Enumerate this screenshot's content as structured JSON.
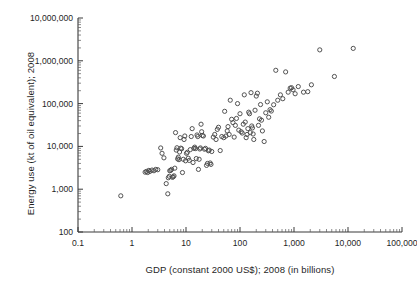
{
  "chart_data": {
    "type": "scatter",
    "title": "",
    "subtitle": "",
    "xlabel": "GDP (constant 2000 US$); 2008 (in billions)",
    "ylabel": "Energy use (kt of oil equivalent); 2008",
    "xscale": "log",
    "yscale": "log",
    "xlim": [
      0.1,
      100000
    ],
    "ylim": [
      100,
      10000000
    ],
    "grid": false,
    "legend": null,
    "annotations": [],
    "marker": "open-circle",
    "xticklabels": [
      "0.1",
      "1",
      "10",
      "100",
      "1,000",
      "10,000",
      "100,000"
    ],
    "yticklabels": [
      "100",
      "1,000",
      "10,000",
      "100,000",
      "1,000,000",
      "10,000,000"
    ],
    "xtickvalues": [
      0.1,
      1,
      10,
      100,
      1000,
      10000,
      100000
    ],
    "ytickvalues": [
      100,
      1000,
      10000,
      100000,
      1000000,
      10000000
    ],
    "series": [
      {
        "name": "countries",
        "n_points": 139,
        "points": [
          [
            0.62,
            700
          ],
          [
            1.75,
            2500
          ],
          [
            1.85,
            2600
          ],
          [
            1.95,
            2450
          ],
          [
            2.05,
            2750
          ],
          [
            2.15,
            2600
          ],
          [
            2.35,
            2800
          ],
          [
            2.55,
            2700
          ],
          [
            2.75,
            2900
          ],
          [
            3.0,
            2850
          ],
          [
            3.4,
            9200
          ],
          [
            3.6,
            6900
          ],
          [
            3.9,
            5400
          ],
          [
            4.3,
            1350
          ],
          [
            4.6,
            780
          ],
          [
            4.7,
            1850
          ],
          [
            4.9,
            2000
          ],
          [
            5.0,
            2700
          ],
          [
            5.2,
            2750
          ],
          [
            5.4,
            2900
          ],
          [
            5.6,
            1900
          ],
          [
            5.8,
            1950
          ],
          [
            6.0,
            2050
          ],
          [
            6.2,
            3100
          ],
          [
            6.4,
            21000
          ],
          [
            6.6,
            8200
          ],
          [
            6.8,
            9300
          ],
          [
            7.0,
            5100
          ],
          [
            7.2,
            5600
          ],
          [
            7.4,
            4900
          ],
          [
            7.6,
            7400
          ],
          [
            7.8,
            16000
          ],
          [
            8.0,
            9100
          ],
          [
            8.3,
            8800
          ],
          [
            8.6,
            2450
          ],
          [
            8.9,
            5000
          ],
          [
            9.2,
            14500
          ],
          [
            9.5,
            17500
          ],
          [
            9.8,
            4600
          ],
          [
            10.2,
            6900
          ],
          [
            10.6,
            7300
          ],
          [
            11.0,
            5300
          ],
          [
            11.5,
            4700
          ],
          [
            12.0,
            8400
          ],
          [
            12.5,
            17000
          ],
          [
            13.0,
            26000
          ],
          [
            13.5,
            4200
          ],
          [
            14.0,
            9000
          ],
          [
            14.5,
            9600
          ],
          [
            15.0,
            8900
          ],
          [
            15.5,
            5200
          ],
          [
            16.0,
            18500
          ],
          [
            16.5,
            17000
          ],
          [
            17.0,
            2900
          ],
          [
            17.5,
            5000
          ],
          [
            18.0,
            8700
          ],
          [
            18.5,
            9200
          ],
          [
            19.0,
            33000
          ],
          [
            19.5,
            22000
          ],
          [
            20.0,
            18000
          ],
          [
            21.0,
            17500
          ],
          [
            22.0,
            8600
          ],
          [
            23.0,
            9000
          ],
          [
            24.0,
            3600
          ],
          [
            25.0,
            4000
          ],
          [
            26.0,
            7900
          ],
          [
            27.0,
            8200
          ],
          [
            28.0,
            4100
          ],
          [
            29.0,
            3800
          ],
          [
            30.0,
            7600
          ],
          [
            32.0,
            16500
          ],
          [
            34.0,
            19000
          ],
          [
            36.0,
            14500
          ],
          [
            38.0,
            25000
          ],
          [
            40.0,
            28000
          ],
          [
            43.0,
            8000
          ],
          [
            46.0,
            17000
          ],
          [
            50.0,
            16000
          ],
          [
            52.0,
            66000
          ],
          [
            55.0,
            17500
          ],
          [
            58.0,
            23000
          ],
          [
            60.0,
            29000
          ],
          [
            63.0,
            19000
          ],
          [
            66.0,
            120000
          ],
          [
            70.0,
            43000
          ],
          [
            74.0,
            36000
          ],
          [
            78.0,
            16500
          ],
          [
            82.0,
            31000
          ],
          [
            86.0,
            45000
          ],
          [
            90.0,
            100000
          ],
          [
            95.0,
            24000
          ],
          [
            100.0,
            58000
          ],
          [
            105.0,
            22000
          ],
          [
            110.0,
            20500
          ],
          [
            115.0,
            33000
          ],
          [
            120.0,
            160000
          ],
          [
            125.0,
            37000
          ],
          [
            130.0,
            16000
          ],
          [
            135.0,
            19000
          ],
          [
            140.0,
            26000
          ],
          [
            145.0,
            63000
          ],
          [
            150.0,
            58000
          ],
          [
            155.0,
            21000
          ],
          [
            160.0,
            180000
          ],
          [
            165.0,
            30000
          ],
          [
            170.0,
            27000
          ],
          [
            175.0,
            19500
          ],
          [
            180.0,
            14500
          ],
          [
            190.0,
            70000
          ],
          [
            200.0,
            150000
          ],
          [
            210.0,
            175000
          ],
          [
            220.0,
            31000
          ],
          [
            230.0,
            44000
          ],
          [
            240.0,
            95000
          ],
          [
            250.0,
            41000
          ],
          [
            260.0,
            23000
          ],
          [
            280.0,
            13000
          ],
          [
            300.0,
            61000
          ],
          [
            320.0,
            110000
          ],
          [
            340.0,
            48000
          ],
          [
            360.0,
            72000
          ],
          [
            380.0,
            67000
          ],
          [
            420.0,
            94000
          ],
          [
            460.0,
            600000
          ],
          [
            500.0,
            120000
          ],
          [
            560.0,
            160000
          ],
          [
            620.0,
            130000
          ],
          [
            700.0,
            550000
          ],
          [
            780.0,
            185000
          ],
          [
            850.0,
            230000
          ],
          [
            900.0,
            235000
          ],
          [
            960.0,
            210000
          ],
          [
            1050.0,
            170000
          ],
          [
            1200.0,
            250000
          ],
          [
            1500.0,
            185000
          ],
          [
            1800.0,
            190000
          ],
          [
            2100.0,
            275000
          ],
          [
            3000.0,
            1800000
          ],
          [
            5600.0,
            430000
          ],
          [
            12500.0,
            1950000
          ]
        ]
      }
    ]
  }
}
